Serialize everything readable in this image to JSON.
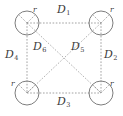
{
  "figure": {
    "type": "geometric-diagram",
    "background_color": "#ffffff",
    "line_color": "#8a8a8a",
    "circle_stroke_color": "#6e6e6e",
    "label_color": "#3a3a3a"
  },
  "circles": [
    {
      "id": "top-left",
      "cx": 27,
      "cy": 23,
      "r": 12,
      "radius_label": "r"
    },
    {
      "id": "top-right",
      "cx": 101,
      "cy": 23,
      "r": 12,
      "radius_label": "r"
    },
    {
      "id": "bottom-left",
      "cx": 27,
      "cy": 93,
      "r": 12,
      "radius_label": "r"
    },
    {
      "id": "bottom-right",
      "cx": 101,
      "cy": 93,
      "r": 12,
      "radius_label": "r"
    }
  ],
  "distance_labels": {
    "d1": {
      "base": "D",
      "sub": "1"
    },
    "d2": {
      "base": "D",
      "sub": "2"
    },
    "d3": {
      "base": "D",
      "sub": "3"
    },
    "d4": {
      "base": "D",
      "sub": "4"
    },
    "d5": {
      "base": "D",
      "sub": "5"
    },
    "d6": {
      "base": "D",
      "sub": "6"
    }
  },
  "radius_labels": {
    "top_left": "r",
    "top_right": "r",
    "bottom_left": "r",
    "bottom_right": "r"
  }
}
